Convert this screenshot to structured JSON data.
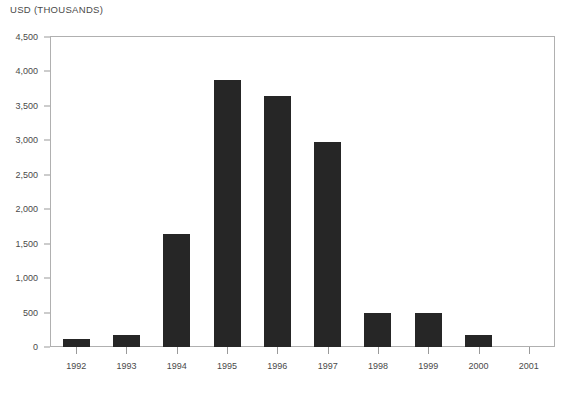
{
  "chart_data": {
    "type": "bar",
    "title": "",
    "subtitle": "",
    "xlabel": "",
    "ylabel": "USD (THOUSANDS)",
    "categories": [
      "1992",
      "1993",
      "1994",
      "1995",
      "1996",
      "1997",
      "1998",
      "1999",
      "2000",
      "2001"
    ],
    "values": [
      115,
      175,
      1640,
      3880,
      3640,
      2980,
      490,
      500,
      175,
      0
    ],
    "ylim": [
      0,
      4500
    ],
    "ytick_values": [
      0,
      500,
      1000,
      1500,
      2000,
      2500,
      3000,
      3500,
      4000,
      4500
    ],
    "ytick_labels": [
      "0",
      "500",
      "1,000",
      "1,500",
      "2,000",
      "2,500",
      "3,000",
      "3,500",
      "4,000",
      "4,500"
    ],
    "grid": false,
    "legend": null,
    "legend_position": "none",
    "bar_color": "#262626",
    "frame_color": "#b0b0b0",
    "text_color": "#4a4a4a",
    "annotations": []
  },
  "axis_caption": "USD (THOUSANDS)"
}
